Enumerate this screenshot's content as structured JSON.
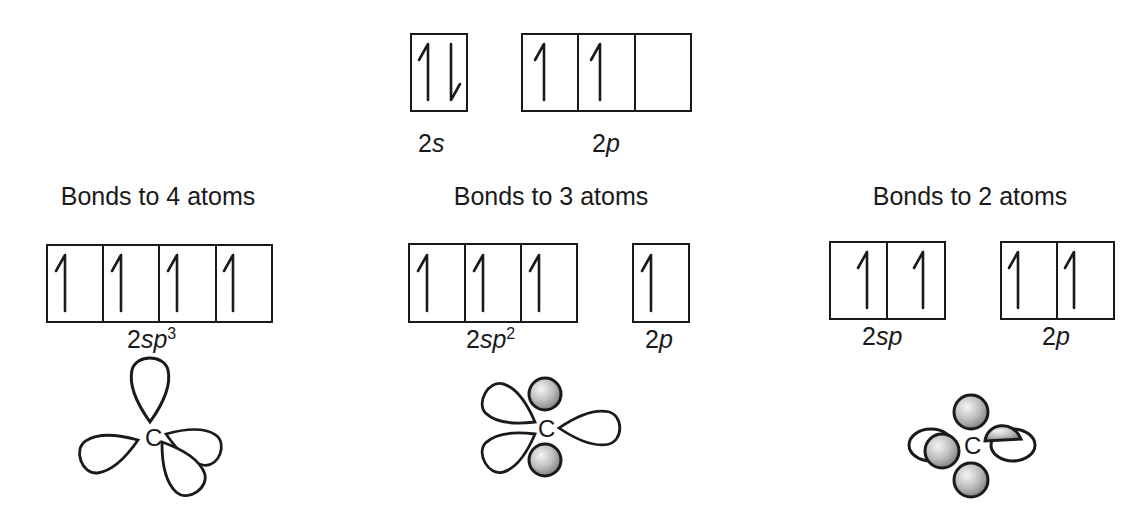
{
  "ground_state": {
    "s_label_num": "2",
    "s_label_sym": "s",
    "p_label_num": "2",
    "p_label_sym": "p",
    "s_orbital": [
      "up-down"
    ],
    "p_orbitals": [
      "up",
      "up",
      "empty"
    ]
  },
  "panels": [
    {
      "title": "Bonds to 4 atoms",
      "hybrid_label_num": "2",
      "hybrid_label_sym": "sp",
      "hybrid_label_sup": "3",
      "hybrid_orbitals": [
        "up",
        "up",
        "up",
        "up"
      ],
      "atom": "C"
    },
    {
      "title": "Bonds to 3 atoms",
      "hybrid_label_num": "2",
      "hybrid_label_sym": "sp",
      "hybrid_label_sup": "2",
      "hybrid_orbitals": [
        "up",
        "up",
        "up"
      ],
      "p_label_num": "2",
      "p_label_sym": "p",
      "p_orbitals": [
        "up"
      ],
      "atom": "C"
    },
    {
      "title": "Bonds to 2 atoms",
      "hybrid_label_num": "2",
      "hybrid_label_sym": "sp",
      "hybrid_label_sup": "",
      "hybrid_orbitals": [
        "up",
        "up"
      ],
      "p_label_num": "2",
      "p_label_sym": "p",
      "p_orbitals": [
        "up",
        "up"
      ],
      "atom": "C"
    }
  ]
}
